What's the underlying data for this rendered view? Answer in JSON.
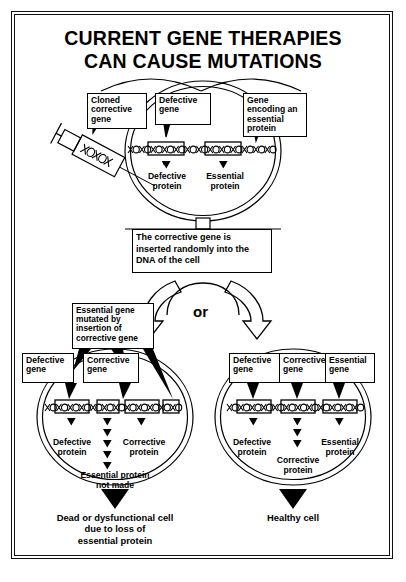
{
  "title": {
    "line1": "CURRENT GENE THERAPIES",
    "line2": "CAN CAUSE MUTATIONS"
  },
  "top_cell": {
    "callouts": [
      {
        "name": "cloned-corrective-gene",
        "text": "Cloned corrective gene"
      },
      {
        "name": "defective-gene",
        "text": "Defective gene"
      },
      {
        "name": "gene-encoding-essential-protein",
        "text": "Gene encoding an essential protein"
      }
    ],
    "products": [
      {
        "name": "defective-protein",
        "line1": "Defective",
        "line2": "protein"
      },
      {
        "name": "essential-protein",
        "line1": "Essential",
        "line2": "protein"
      }
    ],
    "syringe_label": "syringe-with-cloned-gene"
  },
  "middle": {
    "statement": "The corrective gene is inserted randomly into the DNA of the cell",
    "branch_label": "or"
  },
  "left_cell": {
    "callouts": [
      {
        "name": "essential-gene-mutated",
        "text": "Essential gene mutated by insertion of corrective gene"
      },
      {
        "name": "defective-gene",
        "text": "Defective gene"
      },
      {
        "name": "corrective-gene",
        "text": "Corrective gene"
      }
    ],
    "products": [
      {
        "name": "defective-protein",
        "line1": "Defective",
        "line2": "protein"
      },
      {
        "name": "corrective-protein",
        "line1": "Corrective",
        "line2": "protein"
      }
    ],
    "no_protein": {
      "line1": "Essential protein",
      "line2": "not made"
    },
    "outcome": {
      "line1": "Dead or dysfunctional cell",
      "line2": "due to loss of",
      "line3": "essential protein"
    }
  },
  "right_cell": {
    "callouts": [
      {
        "name": "defective-gene",
        "text": "Defective gene"
      },
      {
        "name": "corrective-gene",
        "text": "Corrective gene"
      },
      {
        "name": "essential-gene",
        "text": "Essential gene"
      }
    ],
    "products": [
      {
        "name": "defective-protein",
        "line1": "Defective",
        "line2": "protein"
      },
      {
        "name": "essential-protein",
        "line1": "Essential",
        "line2": "protein"
      },
      {
        "name": "corrective-protein",
        "line1": "Corrective",
        "line2": "protein"
      }
    ],
    "outcome": {
      "line1": "Healthy cell"
    }
  },
  "colors": {
    "ink": "#000000",
    "paper": "#ffffff"
  }
}
